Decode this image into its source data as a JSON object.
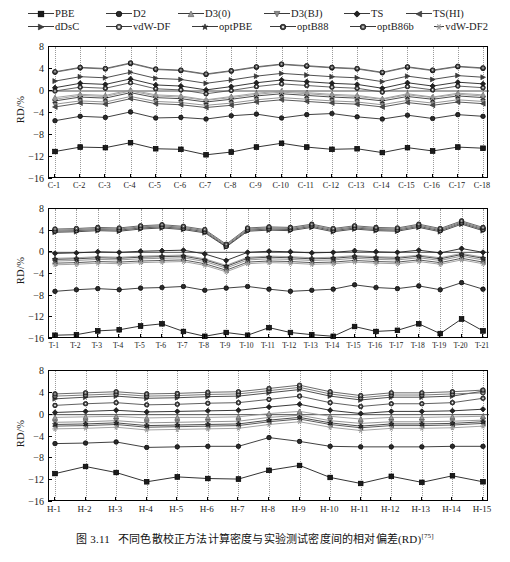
{
  "figure": {
    "caption_prefix": "图 3.11",
    "caption_text": "不同色散校正方法计算密度与实验测试密度间的相对偏差(RD)",
    "caption_ref": "[75]"
  },
  "legend": {
    "rows": [
      [
        {
          "label": "PBE",
          "marker": "square",
          "color": "#1c1c1c"
        },
        {
          "label": "D2",
          "marker": "circle",
          "color": "#2b2b2b"
        },
        {
          "label": "D3(0)",
          "marker": "triangle-up",
          "color": "#9a9a9a"
        },
        {
          "label": "D3(BJ)",
          "marker": "triangle-down",
          "color": "#8a8a8a"
        },
        {
          "label": "TS",
          "marker": "diamond",
          "color": "#232323"
        },
        {
          "label": "TS(HI)",
          "marker": "triangle-left",
          "color": "#4a4a4a"
        }
      ],
      [
        {
          "label": "dDsC",
          "marker": "triangle-right",
          "color": "#3c3c3c"
        },
        {
          "label": "vdW-DF",
          "marker": "circle-dot",
          "color": "#6e6e6e"
        },
        {
          "label": "optPBE",
          "marker": "star",
          "color": "#3a3a3a"
        },
        {
          "label": "optB88",
          "marker": "circle-dot",
          "color": "#4f4f4f"
        },
        {
          "label": "optB86b",
          "marker": "circle-open",
          "color": "#5a5a5a"
        },
        {
          "label": "vdW-DF2",
          "marker": "asterisk",
          "color": "#9a9a9a"
        }
      ]
    ]
  },
  "chart_data": [
    {
      "type": "line",
      "title": "",
      "panel_id": "panel-c",
      "xlabel": "",
      "ylabel": "RD/%",
      "ylim": [
        -16,
        8
      ],
      "yticks": [
        8,
        4,
        0,
        -4,
        -8,
        -12,
        -16
      ],
      "grid": true,
      "legend_position": "above-figure",
      "categories": [
        "C-1",
        "C-2",
        "C-3",
        "C-4",
        "C-5",
        "C-6",
        "C-7",
        "C-8",
        "C-9",
        "C-10",
        "C-11",
        "C-12",
        "C-13",
        "C-14",
        "C-15",
        "C-16",
        "C-17",
        "C-18"
      ],
      "series": [
        {
          "name": "PBE",
          "values": [
            -11.0,
            -10.2,
            -10.3,
            -9.4,
            -10.5,
            -10.6,
            -11.6,
            -11.1,
            -10.2,
            -9.5,
            -10.2,
            -10.6,
            -10.5,
            -11.2,
            -10.3,
            -10.9,
            -10.2,
            -10.4
          ]
        },
        {
          "name": "D2",
          "values": [
            -5.4,
            -4.6,
            -4.8,
            -3.8,
            -4.9,
            -4.8,
            -5.1,
            -4.5,
            -4.2,
            -4.9,
            -4.3,
            -4.1,
            -4.7,
            -5.1,
            -4.4,
            -5.0,
            -4.3,
            -4.6
          ]
        },
        {
          "name": "D3(0)",
          "values": [
            -1.2,
            -0.6,
            -0.8,
            0.2,
            -0.7,
            -0.9,
            -1.6,
            -1.0,
            -0.4,
            0.0,
            -0.3,
            -0.6,
            -0.8,
            -1.4,
            -0.5,
            -1.1,
            -0.4,
            -0.7
          ]
        },
        {
          "name": "D3(BJ)",
          "values": [
            -2.4,
            -1.8,
            -2.0,
            -1.0,
            -1.9,
            -2.1,
            -2.6,
            -2.2,
            -1.6,
            -1.2,
            -1.5,
            -1.8,
            -2.0,
            -2.5,
            -1.7,
            -2.2,
            -1.6,
            -1.9
          ]
        },
        {
          "name": "TS",
          "values": [
            0.6,
            1.4,
            1.2,
            2.2,
            1.1,
            0.9,
            0.2,
            0.8,
            1.5,
            2.0,
            1.7,
            1.4,
            1.2,
            0.5,
            1.5,
            0.9,
            1.6,
            1.3
          ]
        },
        {
          "name": "TS(HI)",
          "values": [
            -2.9,
            -2.2,
            -2.4,
            -1.4,
            -2.3,
            -2.5,
            -3.0,
            -2.6,
            -2.0,
            -1.6,
            -1.9,
            -2.2,
            -2.4,
            -2.9,
            -2.1,
            -2.6,
            -2.0,
            -2.3
          ]
        },
        {
          "name": "dDsC",
          "values": [
            1.8,
            2.6,
            2.4,
            3.4,
            2.3,
            2.1,
            1.4,
            2.0,
            2.7,
            3.2,
            2.9,
            2.6,
            2.4,
            1.7,
            2.7,
            2.1,
            2.8,
            2.5
          ]
        },
        {
          "name": "vdW-DF",
          "values": [
            3.4,
            4.2,
            4.0,
            5.0,
            3.9,
            3.7,
            3.0,
            3.6,
            4.3,
            4.8,
            4.5,
            4.2,
            4.0,
            3.3,
            4.3,
            3.7,
            4.4,
            4.1
          ]
        },
        {
          "name": "optPBE",
          "values": [
            -1.8,
            -1.1,
            -1.3,
            -0.3,
            -1.2,
            -1.4,
            -2.0,
            -1.5,
            -0.9,
            -0.5,
            -0.8,
            -1.1,
            -1.3,
            -1.8,
            -1.0,
            -1.5,
            -0.9,
            -1.2
          ]
        },
        {
          "name": "optB88",
          "values": [
            0.0,
            0.7,
            0.5,
            1.5,
            0.4,
            0.2,
            -0.5,
            0.1,
            0.8,
            1.3,
            1.0,
            0.7,
            0.5,
            -0.2,
            0.8,
            0.2,
            0.9,
            0.6
          ]
        },
        {
          "name": "optB86b",
          "values": [
            3.5,
            4.3,
            4.1,
            5.1,
            4.0,
            3.8,
            3.1,
            3.7,
            4.4,
            4.9,
            4.6,
            4.3,
            4.1,
            3.4,
            4.4,
            3.8,
            4.5,
            4.2
          ]
        },
        {
          "name": "vdW-DF2",
          "values": [
            -1.5,
            -0.8,
            -1.0,
            0.0,
            -0.9,
            -1.1,
            -1.7,
            -1.2,
            -0.6,
            -0.2,
            -0.5,
            -0.8,
            -1.0,
            -1.5,
            -0.7,
            -1.2,
            -0.6,
            -0.9
          ]
        }
      ]
    },
    {
      "type": "line",
      "title": "",
      "panel_id": "panel-t",
      "xlabel": "",
      "ylabel": "RD/%",
      "ylim": [
        -16,
        8
      ],
      "yticks": [
        8,
        4,
        0,
        -4,
        -8,
        -12,
        -16
      ],
      "grid": true,
      "legend_position": "above-figure",
      "categories": [
        "T-1",
        "T-2",
        "T-3",
        "T-4",
        "T-5",
        "T-6",
        "T-7",
        "T-8",
        "T-9",
        "T-10",
        "T-11",
        "T-12",
        "T-13",
        "T-14",
        "T-15",
        "T-16",
        "T-17",
        "T-18",
        "T-19",
        "T-20",
        "T-21"
      ],
      "series": [
        {
          "name": "PBE",
          "values": [
            -15.3,
            -15.2,
            -14.5,
            -14.3,
            -13.6,
            -13.2,
            -14.6,
            -15.5,
            -14.8,
            -15.3,
            -13.9,
            -14.8,
            -15.2,
            -15.5,
            -13.7,
            -14.6,
            -14.4,
            -13.2,
            -15.0,
            -12.3,
            -14.5
          ]
        },
        {
          "name": "D2",
          "values": [
            -7.2,
            -6.9,
            -6.7,
            -6.9,
            -6.6,
            -6.5,
            -6.3,
            -7.0,
            -6.6,
            -6.3,
            -6.8,
            -7.2,
            -7.0,
            -6.8,
            -6.0,
            -6.5,
            -6.7,
            -6.2,
            -6.9,
            -5.6,
            -6.8
          ]
        },
        {
          "name": "D3(0)",
          "values": [
            -1.1,
            -1.0,
            -0.8,
            -0.9,
            -0.7,
            -0.6,
            -0.5,
            -1.2,
            -2.4,
            -0.9,
            -0.7,
            -0.8,
            -1.0,
            -0.9,
            -0.6,
            -0.8,
            -0.9,
            -0.5,
            -1.0,
            -0.2,
            -0.9
          ]
        },
        {
          "name": "D3(BJ)",
          "values": [
            -1.6,
            -1.5,
            -1.3,
            -1.4,
            -1.2,
            -1.1,
            -1.0,
            -1.7,
            -2.9,
            -1.4,
            -1.2,
            -1.3,
            -1.5,
            -1.4,
            -1.1,
            -1.3,
            -1.4,
            -1.0,
            -1.5,
            -0.7,
            -1.4
          ]
        },
        {
          "name": "TS",
          "values": [
            -0.2,
            -0.1,
            0.1,
            0.0,
            0.2,
            0.3,
            0.4,
            -0.3,
            -1.5,
            0.0,
            0.2,
            0.1,
            -0.1,
            0.0,
            0.3,
            0.1,
            0.0,
            0.4,
            -0.1,
            0.7,
            0.0
          ]
        },
        {
          "name": "TS(HI)",
          "values": [
            -2.0,
            -1.9,
            -1.7,
            -1.8,
            -1.6,
            -1.5,
            -1.4,
            -2.1,
            -3.3,
            -1.8,
            -1.6,
            -1.7,
            -1.9,
            -1.8,
            -1.5,
            -1.7,
            -1.8,
            -1.4,
            -1.9,
            -1.1,
            -1.8
          ]
        },
        {
          "name": "dDsC",
          "values": [
            3.7,
            3.8,
            4.0,
            3.9,
            4.3,
            4.5,
            4.2,
            3.6,
            1.0,
            3.9,
            4.1,
            4.0,
            4.6,
            3.8,
            4.3,
            4.0,
            3.9,
            4.6,
            3.8,
            5.2,
            4.0
          ]
        },
        {
          "name": "vdW-DF",
          "values": [
            4.1,
            4.2,
            4.4,
            4.3,
            4.7,
            4.9,
            4.6,
            4.0,
            1.3,
            4.3,
            4.5,
            4.4,
            5.0,
            4.2,
            4.7,
            4.4,
            4.3,
            5.0,
            4.2,
            5.6,
            4.4
          ]
        },
        {
          "name": "optPBE",
          "values": [
            -1.3,
            -1.2,
            -1.0,
            -1.1,
            -0.9,
            -0.8,
            -0.7,
            -1.4,
            -2.6,
            -1.1,
            -0.9,
            -1.0,
            -1.2,
            -1.1,
            -0.8,
            -1.0,
            -1.1,
            -0.7,
            -1.2,
            -0.4,
            -1.1
          ]
        },
        {
          "name": "optB88",
          "values": [
            3.9,
            4.0,
            4.2,
            4.1,
            4.5,
            4.7,
            4.4,
            3.8,
            1.1,
            4.1,
            4.3,
            4.2,
            4.8,
            4.0,
            4.5,
            4.2,
            4.1,
            4.8,
            4.0,
            5.4,
            4.2
          ]
        },
        {
          "name": "optB86b",
          "values": [
            4.3,
            4.4,
            4.6,
            4.5,
            4.9,
            5.1,
            4.8,
            4.2,
            1.5,
            4.5,
            4.7,
            4.6,
            5.2,
            4.4,
            4.9,
            4.6,
            4.5,
            5.2,
            4.4,
            5.8,
            4.6
          ]
        },
        {
          "name": "vdW-DF2",
          "values": [
            -2.3,
            -2.2,
            -2.0,
            -2.1,
            -1.9,
            -1.8,
            -1.7,
            -2.4,
            -3.6,
            -2.1,
            -1.9,
            -2.0,
            -2.2,
            -2.1,
            -1.8,
            -2.0,
            -2.1,
            -1.7,
            -2.2,
            -1.4,
            -2.1
          ]
        }
      ]
    },
    {
      "type": "line",
      "title": "",
      "panel_id": "panel-h",
      "xlabel": "",
      "ylabel": "RD/%",
      "ylim": [
        -16,
        8
      ],
      "yticks": [
        8,
        4,
        0,
        -4,
        -8,
        -12,
        -16
      ],
      "grid": true,
      "legend_position": "above-figure",
      "categories": [
        "H-1",
        "H-2",
        "H-3",
        "H-4",
        "H-5",
        "H-6",
        "H-7",
        "H-8",
        "H-9",
        "H-10",
        "H-11",
        "H-12",
        "H-13",
        "H-14",
        "H-15"
      ],
      "series": [
        {
          "name": "PBE",
          "values": [
            -10.8,
            -9.5,
            -10.6,
            -12.3,
            -11.4,
            -11.7,
            -11.8,
            -10.2,
            -9.3,
            -11.5,
            -12.6,
            -11.3,
            -12.4,
            -11.2,
            -12.3
          ]
        },
        {
          "name": "D2",
          "values": [
            -5.3,
            -5.2,
            -5.0,
            -6.0,
            -5.9,
            -5.8,
            -5.8,
            -4.2,
            -4.9,
            -5.8,
            -5.9,
            -5.9,
            -5.9,
            -5.8,
            -5.8
          ]
        },
        {
          "name": "D3(0)",
          "values": [
            -0.5,
            -0.4,
            -0.3,
            -0.6,
            -0.5,
            -0.5,
            -0.4,
            0.2,
            0.6,
            -0.3,
            -0.8,
            -0.5,
            -0.5,
            -0.4,
            -0.3
          ]
        },
        {
          "name": "D3(BJ)",
          "values": [
            -1.4,
            -1.3,
            -1.1,
            -1.5,
            -1.4,
            -1.3,
            -1.2,
            -0.5,
            -0.1,
            -1.1,
            -1.6,
            -1.3,
            -1.3,
            -1.2,
            -1.0
          ]
        },
        {
          "name": "TS",
          "values": [
            0.4,
            0.6,
            0.8,
            0.5,
            0.6,
            0.7,
            0.8,
            1.4,
            1.9,
            0.8,
            0.2,
            0.6,
            0.6,
            0.7,
            1.0
          ]
        },
        {
          "name": "TS(HI)",
          "values": [
            -2.1,
            -2.0,
            -1.8,
            -2.3,
            -2.2,
            -2.1,
            -2.0,
            -1.3,
            -0.8,
            -1.8,
            -2.4,
            -2.0,
            -2.0,
            -1.9,
            -1.6
          ]
        },
        {
          "name": "dDsC",
          "values": [
            2.9,
            3.2,
            3.4,
            3.0,
            3.1,
            3.3,
            3.4,
            4.0,
            4.6,
            3.4,
            2.7,
            3.2,
            3.2,
            3.4,
            4.3
          ]
        },
        {
          "name": "vdW-DF",
          "values": [
            3.4,
            3.6,
            3.8,
            3.4,
            3.5,
            3.7,
            3.8,
            4.4,
            5.0,
            3.8,
            3.1,
            3.6,
            3.6,
            3.8,
            4.0
          ]
        },
        {
          "name": "optPBE",
          "values": [
            -1.8,
            -1.7,
            -1.5,
            -2.0,
            -1.9,
            -1.8,
            -1.7,
            -1.0,
            -0.5,
            -1.5,
            -2.1,
            -1.7,
            -1.7,
            -1.6,
            -1.3
          ]
        },
        {
          "name": "optB88",
          "values": [
            1.7,
            2.0,
            2.2,
            1.8,
            1.9,
            2.1,
            2.2,
            2.8,
            3.4,
            2.2,
            1.5,
            2.0,
            2.0,
            2.2,
            3.0
          ]
        },
        {
          "name": "optB86b",
          "values": [
            3.8,
            4.0,
            4.2,
            3.8,
            3.9,
            4.1,
            4.2,
            4.8,
            5.4,
            4.2,
            3.5,
            4.0,
            4.0,
            4.2,
            4.5
          ]
        },
        {
          "name": "vdW-DF2",
          "values": [
            -2.6,
            -2.5,
            -2.3,
            -2.8,
            -2.7,
            -2.6,
            -2.5,
            -1.8,
            -1.3,
            -2.3,
            -2.9,
            -2.5,
            -2.5,
            -2.4,
            -2.1
          ]
        }
      ]
    }
  ]
}
